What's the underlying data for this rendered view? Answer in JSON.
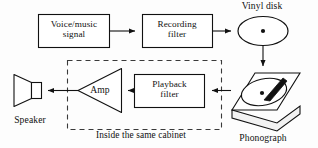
{
  "diagram": {
    "canvas": {
      "width": 318,
      "height": 148,
      "background": "#fdfdfd"
    },
    "stroke_color": "#111111",
    "dashed_color": "#3a3a3a",
    "nodes": {
      "voice_signal": {
        "label": "Voice/music\nsignal",
        "shape": "rectangle"
      },
      "recording_filter": {
        "label": "Recording\nfilter",
        "shape": "rectangle"
      },
      "vinyl_disk": {
        "label": "Vinyl disk",
        "shape": "ellipse"
      },
      "phonograph": {
        "label": "Phonograph",
        "shape": "turntable"
      },
      "playback_filter": {
        "label": "Playback\nfilter",
        "shape": "rectangle"
      },
      "amp": {
        "label": "Amp",
        "shape": "triangle"
      },
      "speaker": {
        "label": "Speaker",
        "shape": "horn"
      }
    },
    "groups": {
      "cabinet": {
        "label": "Inside the same cabinet",
        "style": "dashed"
      }
    }
  }
}
